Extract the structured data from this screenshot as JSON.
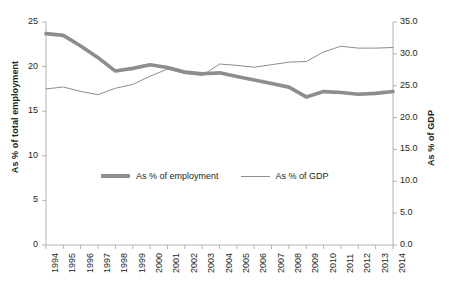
{
  "chart_data": {
    "type": "line",
    "title": "",
    "subtitle": "",
    "xlabel": "",
    "ylabel": "As % of total employment",
    "y2label": "As % of GDP",
    "grid": false,
    "legend_position": "inside-center",
    "categories": [
      "1994",
      "1995",
      "1996",
      "1997",
      "1998",
      "1999",
      "2000",
      "2001",
      "2002",
      "2003",
      "2004",
      "2005",
      "2006",
      "2007",
      "2008",
      "2009",
      "2010",
      "2011",
      "2012",
      "2013",
      "2014"
    ],
    "x": [
      1994,
      1995,
      1996,
      1997,
      1998,
      1999,
      2000,
      2001,
      2002,
      2003,
      2004,
      2005,
      2006,
      2007,
      2008,
      2009,
      2010,
      2011,
      2012,
      2013,
      2014
    ],
    "ylim": [
      0,
      25
    ],
    "yticks": [
      0,
      5,
      10,
      15,
      20,
      25
    ],
    "ytick_labels": [
      "0",
      "5",
      "10",
      "15",
      "20",
      "25"
    ],
    "y2lim": [
      0.0,
      35.0
    ],
    "y2ticks": [
      0.0,
      5.0,
      10.0,
      15.0,
      20.0,
      25.0,
      30.0,
      35.0
    ],
    "y2tick_labels": [
      "0.0",
      "5.0",
      "10.0",
      "15.0",
      "20.0",
      "25.0",
      "30.0",
      "35.0"
    ],
    "series": [
      {
        "name": "As % of employment",
        "axis": "left",
        "color": "#8d8d8d",
        "line_width": 3.6,
        "values": [
          23.7,
          23.5,
          22.3,
          21.0,
          19.5,
          19.8,
          20.2,
          19.9,
          19.4,
          19.2,
          19.3,
          18.9,
          18.5,
          18.1,
          17.7,
          16.6,
          17.2,
          17.1,
          16.9,
          17.0,
          17.2
        ]
      },
      {
        "name": "As % of GDP",
        "axis": "right",
        "color": "#8d8d8d",
        "line_width": 1.0,
        "values": [
          24.5,
          24.8,
          24.1,
          23.6,
          24.6,
          25.2,
          26.5,
          27.6,
          26.9,
          26.6,
          28.4,
          28.2,
          27.9,
          28.3,
          28.7,
          28.8,
          30.3,
          31.2,
          30.9,
          30.9,
          31.0
        ]
      }
    ]
  },
  "legend": {
    "items": [
      {
        "label": "As % of employment",
        "style": "thick",
        "color": "#8d8d8d"
      },
      {
        "label": "As % of GDP",
        "style": "thin",
        "color": "#8d8d8d"
      }
    ]
  },
  "axes": {
    "left_title": "As % of total employment",
    "right_title": "As % of GDP"
  },
  "colors": {
    "series_gray": "#8d8d8d",
    "axis_gray": "#b3b3b3",
    "text": "#231f20",
    "background": "#ffffff"
  }
}
